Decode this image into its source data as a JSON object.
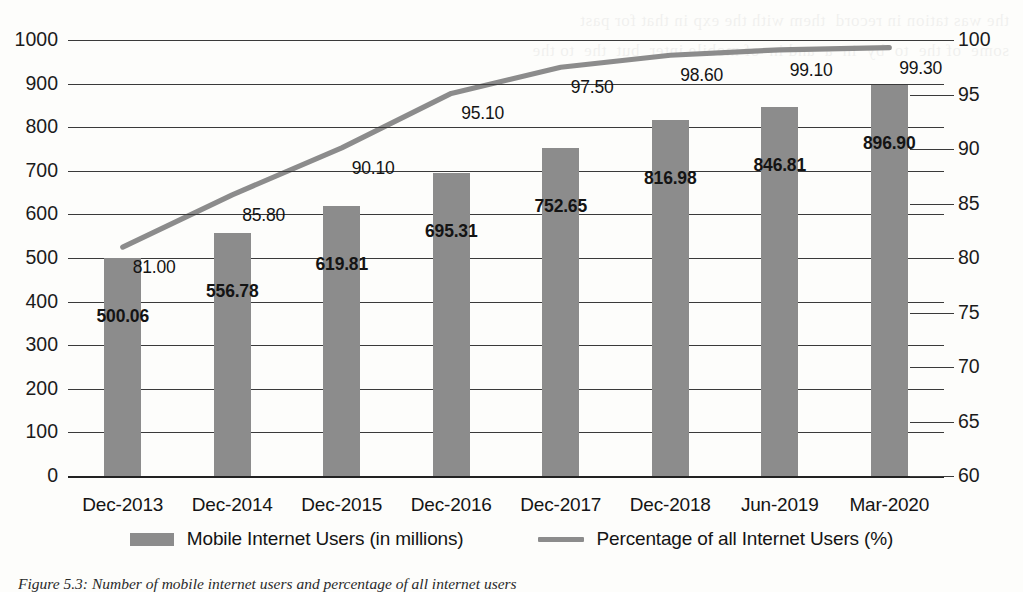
{
  "chart_data": {
    "type": "bar",
    "title": "",
    "subtitle": "",
    "xlabel": "",
    "ylabel": "",
    "grid": true,
    "legend_position": "bottom",
    "categories": [
      "Dec-2013",
      "Dec-2014",
      "Dec-2015",
      "Dec-2016",
      "Dec-2017",
      "Dec-2018",
      "Jun-2019",
      "Mar-2020"
    ],
    "series": [
      {
        "name": "Mobile Internet Users (in millions)",
        "type": "bar",
        "axis": "left",
        "color": "#8c8c8c",
        "values": [
          500.06,
          556.78,
          619.81,
          695.31,
          752.65,
          816.98,
          846.81,
          896.9
        ],
        "value_labels": [
          "500.06",
          "556.78",
          "619.81",
          "695.31",
          "752.65",
          "816.98",
          "846.81",
          "896.90"
        ]
      },
      {
        "name": "Percentage of all Internet Users (%)",
        "type": "line",
        "axis": "right",
        "color": "#8c8c8c",
        "values": [
          81.0,
          85.8,
          90.1,
          95.1,
          97.5,
          98.6,
          99.1,
          99.3
        ],
        "value_labels": [
          "81.00",
          "85.80",
          "90.10",
          "95.10",
          "97.50",
          "98.60",
          "99.10",
          "99.30"
        ]
      }
    ],
    "left_axis": {
      "min": 0,
      "max": 1000,
      "step": 100,
      "ticks": [
        "0",
        "100",
        "200",
        "300",
        "400",
        "500",
        "600",
        "700",
        "800",
        "900",
        "1000"
      ]
    },
    "right_axis": {
      "min": 60,
      "max": 100,
      "step": 5,
      "ticks": [
        "60",
        "65",
        "70",
        "75",
        "80",
        "85",
        "90",
        "95",
        "100"
      ]
    }
  },
  "legend": {
    "items": [
      {
        "label": "Mobile Internet Users (in millions)",
        "marker": "bar-swatch"
      },
      {
        "label": "Percentage of all Internet Users (%)",
        "marker": "line-swatch"
      }
    ]
  },
  "caption": {
    "text": "Figure 5.3: Number of mobile internet users and percentage of all internet users"
  },
  "bleed_text": {
    "text": "the was tation in record  them with the exp in that for past\nsome  of the  to  by  in  a  and in  of mobile inter  but  the  to the"
  }
}
